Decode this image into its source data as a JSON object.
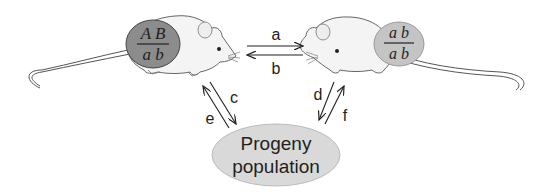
{
  "diagram": {
    "left_mouse": {
      "genotype_top": "A B",
      "genotype_bottom": "a b",
      "fill": "#8c8c8c"
    },
    "right_mouse": {
      "genotype_top": "a b",
      "genotype_bottom": "a b",
      "fill": "#c4c4c4"
    },
    "arrows": {
      "a": "a",
      "b": "b",
      "c": "c",
      "d": "d",
      "e": "e",
      "f": "f"
    },
    "progeny": {
      "line1": "Progeny",
      "line2": "population",
      "fill": "#d9d9d9"
    }
  }
}
